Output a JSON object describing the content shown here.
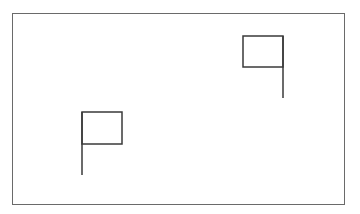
{
  "diagram": {
    "frame": {
      "x": 12,
      "y": 13,
      "width": 333,
      "height": 192,
      "stroke": "#6a6a6a"
    },
    "flags": [
      {
        "name": "flag-upper-right",
        "flag_rect": {
          "x": 243,
          "y": 36,
          "width": 40,
          "height": 31
        },
        "pole": {
          "x": 283,
          "y1": 36,
          "y2": 98
        },
        "pole_side": "right",
        "stroke": "#3a3a3a"
      },
      {
        "name": "flag-lower-left",
        "flag_rect": {
          "x": 82,
          "y": 112,
          "width": 40,
          "height": 32
        },
        "pole": {
          "x": 82,
          "y1": 112,
          "y2": 175
        },
        "pole_side": "left",
        "stroke": "#3a3a3a"
      }
    ]
  }
}
